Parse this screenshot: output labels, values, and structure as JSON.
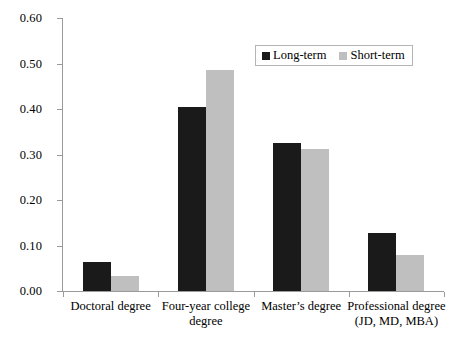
{
  "chart_data": {
    "type": "bar",
    "title": "",
    "xlabel": "",
    "ylabel": "",
    "ylim": [
      0.0,
      0.6
    ],
    "grid": false,
    "legend_position": "top-right",
    "categories": [
      "Doctoral degree",
      "Four-year college degree",
      "Master’s degree",
      "Professional degree (JD, MD, MBA)"
    ],
    "category_lines": [
      [
        "Doctoral degree"
      ],
      [
        "Four-year college",
        "degree"
      ],
      [
        "Master’s degree"
      ],
      [
        "Professional degree",
        "(JD, MD, MBA)"
      ]
    ],
    "series": [
      {
        "name": "Long-term",
        "color": "#1a1a1a",
        "values": [
          0.063,
          0.405,
          0.325,
          0.127
        ]
      },
      {
        "name": "Short-term",
        "color": "#bfbfbf",
        "values": [
          0.033,
          0.485,
          0.312,
          0.079
        ]
      }
    ],
    "y_ticks": [
      {
        "value": 0.0,
        "label": "0.00"
      },
      {
        "value": 0.1,
        "label": "0.10"
      },
      {
        "value": 0.2,
        "label": "0.20"
      },
      {
        "value": 0.3,
        "label": "0.30"
      },
      {
        "value": 0.4,
        "label": "0.40"
      },
      {
        "value": 0.5,
        "label": "0.50"
      },
      {
        "value": 0.6,
        "label": "0.60"
      }
    ]
  },
  "legend": {
    "entries": [
      {
        "label": "Long-term",
        "color": "#1a1a1a"
      },
      {
        "label": "Short-term",
        "color": "#bfbfbf"
      }
    ]
  }
}
